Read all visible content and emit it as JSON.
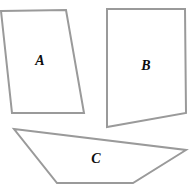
{
  "figure": {
    "canvas": {
      "width": 192,
      "height": 191
    },
    "background_color": "#ffffff",
    "stroke_color": "#9a9a9a",
    "fill_color": "#ffffff",
    "stroke_width": 2,
    "label_color": "#0d0d0d",
    "shapes": [
      {
        "id": "shape-a",
        "label": "A",
        "kind": "quadrilateral",
        "points": "1,11 66,10 84,113 12,113",
        "label_x": 40,
        "label_y": 62
      },
      {
        "id": "shape-b",
        "label": "B",
        "kind": "quadrilateral",
        "points": "107,9 185,9 186,113 107,127",
        "label_x": 146,
        "label_y": 67
      },
      {
        "id": "shape-c",
        "label": "C",
        "kind": "quadrilateral",
        "points": "14,129 186,150 133,183 57,183",
        "label_x": 96,
        "label_y": 160
      }
    ]
  }
}
